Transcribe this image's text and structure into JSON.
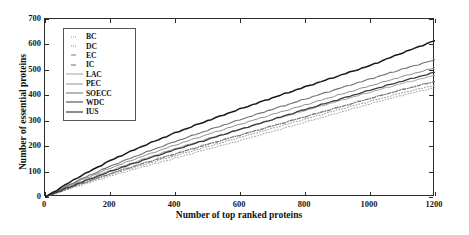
{
  "chart_data": {
    "type": "line",
    "title": "",
    "xlabel": "Number of top ranked proteins",
    "ylabel": "Number of essential proteins",
    "xlim": [
      0,
      1200
    ],
    "ylim": [
      0,
      700
    ],
    "xticks": [
      0,
      200,
      400,
      600,
      800,
      1000,
      1200
    ],
    "yticks": [
      0,
      100,
      200,
      300,
      400,
      500,
      600,
      700
    ],
    "grid": false,
    "legend_position": "upper left",
    "x": [
      0,
      100,
      200,
      300,
      400,
      500,
      600,
      700,
      800,
      900,
      1000,
      1100,
      1200
    ],
    "series": [
      {
        "name": "BC",
        "color": "#9a9a9a",
        "style": "dotted",
        "width": 0.9,
        "values": [
          0,
          42,
          82,
          118,
          152,
          188,
          222,
          258,
          294,
          330,
          366,
          400,
          430
        ]
      },
      {
        "name": "DC",
        "color": "#8a8a8a",
        "style": "dotted",
        "width": 0.9,
        "values": [
          0,
          45,
          88,
          126,
          162,
          198,
          234,
          270,
          306,
          342,
          376,
          410,
          440
        ]
      },
      {
        "name": "EC",
        "color": "#7d7d7d",
        "style": "dashdot",
        "width": 0.9,
        "values": [
          0,
          48,
          92,
          132,
          170,
          208,
          244,
          280,
          316,
          352,
          388,
          423,
          455
        ]
      },
      {
        "name": "IC",
        "color": "#6f6f6f",
        "style": "dashdot",
        "width": 0.9,
        "values": [
          0,
          47,
          91,
          131,
          169,
          206,
          243,
          279,
          315,
          351,
          387,
          422,
          454
        ]
      },
      {
        "name": "LAC",
        "color": "#a5a5a5",
        "style": "solid",
        "width": 1.0,
        "values": [
          0,
          55,
          104,
          148,
          190,
          229,
          266,
          303,
          340,
          376,
          412,
          447,
          478
        ]
      },
      {
        "name": "PEC",
        "color": "#8f8f8f",
        "style": "solid",
        "width": 1.0,
        "values": [
          0,
          60,
          113,
          160,
          204,
          246,
          286,
          325,
          362,
          400,
          437,
          474,
          508
        ]
      },
      {
        "name": "SOECC",
        "color": "#707070",
        "style": "solid",
        "width": 1.1,
        "values": [
          0,
          64,
          121,
          171,
          218,
          262,
          304,
          345,
          385,
          425,
          464,
          503,
          540
        ]
      },
      {
        "name": "WDC",
        "color": "#3a3a3a",
        "style": "solid",
        "width": 1.3,
        "values": [
          0,
          52,
          100,
          144,
          186,
          226,
          266,
          305,
          344,
          382,
          420,
          456,
          490
        ]
      },
      {
        "name": "IUS",
        "color": "#1a1a1a",
        "style": "solid",
        "width": 1.5,
        "values": [
          0,
          76,
          143,
          200,
          252,
          300,
          346,
          390,
          433,
          475,
          517,
          567,
          615
        ]
      }
    ]
  }
}
